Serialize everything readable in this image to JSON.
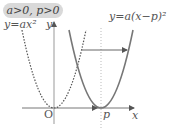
{
  "condition_label": "a>0, p>0",
  "curves": {
    "original": {
      "label": "y=ax²",
      "style": "dashed",
      "vertex": "O"
    },
    "shifted": {
      "label": "y=a(x−p)²",
      "style": "solid",
      "vertex": "p"
    }
  },
  "axes": {
    "x_label": "x",
    "y_label": "y",
    "origin_label": "O"
  },
  "shift_label": "p",
  "colors": {
    "axis": "#666666",
    "curve": "#777777",
    "dashed": "#555555",
    "pill_bg": "#d9d9d9",
    "guide": "#aaaaaa"
  }
}
